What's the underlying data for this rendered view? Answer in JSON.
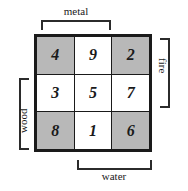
{
  "diagram": {
    "grid": {
      "rows": [
        [
          {
            "value": "4",
            "shaded": true
          },
          {
            "value": "9",
            "shaded": false
          },
          {
            "value": "2",
            "shaded": true
          }
        ],
        [
          {
            "value": "3",
            "shaded": false
          },
          {
            "value": "5",
            "shaded": false
          },
          {
            "value": "7",
            "shaded": false
          }
        ],
        [
          {
            "value": "8",
            "shaded": true
          },
          {
            "value": "1",
            "shaded": false
          },
          {
            "value": "6",
            "shaded": true
          }
        ]
      ]
    },
    "labels": {
      "top": "metal",
      "right": "fire",
      "bottom": "water",
      "left": "wood"
    },
    "colors": {
      "shaded_cell": "#b8b8b8",
      "plain_cell": "#ffffff",
      "grid_border": "#1a1a1a",
      "bracket": "#2b2b2b",
      "text": "#1a1a1a",
      "background": "#ffffff"
    }
  }
}
